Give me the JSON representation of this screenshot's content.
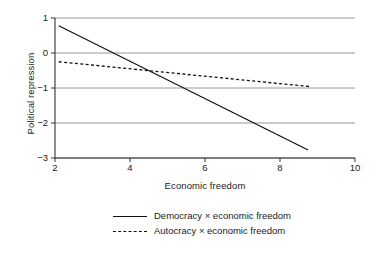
{
  "chart_data": {
    "type": "line",
    "title": "",
    "xlabel": "Economic freedom",
    "ylabel": "Political repression",
    "xlim": [
      2,
      10
    ],
    "ylim": [
      -3,
      1
    ],
    "xticks": [
      2,
      4,
      6,
      8,
      10
    ],
    "yticks": [
      1,
      0,
      -1,
      -2,
      -3
    ],
    "xtick_labels": [
      "2",
      "4",
      "6",
      "8",
      "10"
    ],
    "ytick_labels": [
      "1",
      "0",
      "−1",
      "−2",
      "−3"
    ],
    "grid": "horizontal",
    "legend_position": "below",
    "series": [
      {
        "name": "Democracy × economic freedom",
        "style": "solid",
        "color": "#111111",
        "x": [
          2.1,
          8.75
        ],
        "values": [
          0.78,
          -2.77
        ]
      },
      {
        "name": "Autocracy × economic freedom",
        "style": "dashed",
        "color": "#111111",
        "x": [
          2.1,
          8.8
        ],
        "values": [
          -0.25,
          -0.96
        ]
      }
    ]
  },
  "axes": {
    "y_title": "Political repression",
    "x_title": "Economic freedom",
    "ytick_labels": [
      "1",
      "0",
      "−1",
      "−2",
      "−3"
    ],
    "xtick_labels": [
      "2",
      "4",
      "6",
      "8",
      "10"
    ]
  },
  "legend": {
    "items": [
      {
        "label": "Democracy × economic freedom",
        "style": "solid"
      },
      {
        "label": "Autocracy × economic freedom",
        "style": "dashed"
      }
    ]
  }
}
